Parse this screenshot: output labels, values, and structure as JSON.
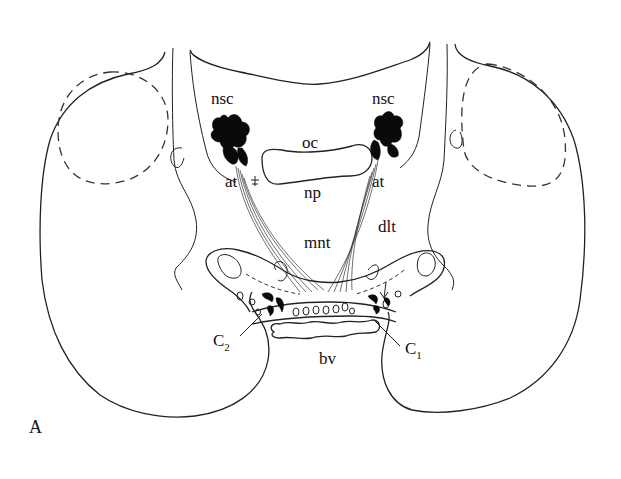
{
  "figure": {
    "panel_label": "A",
    "colors": {
      "line": "#222222",
      "fill": "#0a0a0a",
      "background": "#ffffff"
    },
    "labels": {
      "nsc_left": "nsc",
      "nsc_right": "nsc",
      "oc": "oc",
      "at_left": "at",
      "at_right": "at",
      "np": "np",
      "mnt": "mnt",
      "dlt": "dlt",
      "c2_main": "C",
      "c2_sub": "2",
      "c1_main": "C",
      "c1_sub": "1",
      "bv": "bv"
    }
  }
}
